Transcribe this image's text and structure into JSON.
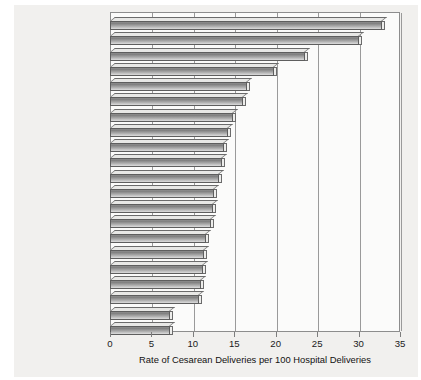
{
  "chart_data": {
    "type": "bar",
    "orientation": "horizontal",
    "title": "",
    "xlabel": "Rate of Cesarean Deliveries per 100 Hospital Deliveries",
    "ylabel": "",
    "xlim": [
      0,
      35
    ],
    "xticks": [
      0,
      5,
      10,
      15,
      20,
      25,
      30,
      35
    ],
    "grid": true,
    "grid_axis": "x",
    "legend": false,
    "categories": [
      "Brazil",
      "Puerto Rico",
      "United States",
      "Canada",
      "Australia",
      "Germany",
      "Scotland",
      "Denmark",
      "Italy",
      "Portugal",
      "Greece",
      "Sweden",
      "Spain",
      "Norway",
      "Switzerland",
      "New Zealand",
      "England and Wales",
      "Netherlands",
      "Hungary",
      "Japan",
      "Czechoslovakia"
    ],
    "values": [
      32.8,
      30.0,
      23.5,
      19.8,
      16.5,
      16.0,
      14.8,
      14.3,
      13.8,
      13.5,
      13.2,
      12.6,
      12.4,
      12.2,
      11.6,
      11.4,
      11.2,
      11.0,
      10.8,
      7.3,
      7.2
    ],
    "series": [
      {
        "name": "Rate of Cesarean Deliveries per 100 Hospital Deliveries",
        "values": [
          32.8,
          30.0,
          23.5,
          19.8,
          16.5,
          16.0,
          14.8,
          14.3,
          13.8,
          13.5,
          13.2,
          12.6,
          12.4,
          12.2,
          11.6,
          11.4,
          11.2,
          11.0,
          10.8,
          7.3,
          7.2
        ]
      }
    ],
    "bar_style": "3d-shaded-horizontal",
    "colors": {
      "bar_fill_dark": "#7e7e7e",
      "bar_fill_light": "#d6d6d6",
      "bar_outline": "#5e5e5e",
      "bar_top_face": "#e8e8e6",
      "grid": "#9a9a9a",
      "frame": "#8d8d8d",
      "plot_background": "#fbfbfa",
      "panel_background": "#f1f0ee",
      "text": "#1a1a1a"
    }
  }
}
